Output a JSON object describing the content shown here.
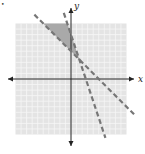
{
  "chart_data": {
    "type": "line",
    "title": "",
    "xlabel": "x",
    "ylabel": "y",
    "xlim": [
      -10,
      10
    ],
    "ylim": [
      -10,
      10
    ],
    "grid": true,
    "grid_step": 1,
    "series": [
      {
        "name": "boundary-1",
        "equation": "y = -x + 5",
        "slope": -1,
        "intercept": 5,
        "style": "dashed"
      },
      {
        "name": "boundary-2",
        "equation": "y = -3x + 8",
        "slope": -3,
        "intercept": 8,
        "style": "dashed"
      }
    ],
    "shaded_region": {
      "description": "solution region: y > -x + 5 and y < -3x + 8",
      "vertex": [
        1.5,
        3.5
      ]
    },
    "colors": {
      "grid_background": "#e4e4e4",
      "grid_lines": "#f6f6f6",
      "shade": "#a9a9a9",
      "lines": "#777777",
      "axes": "#222222"
    }
  },
  "labels": {
    "x_axis": "x",
    "y_axis": "y",
    "bullet": "•"
  }
}
